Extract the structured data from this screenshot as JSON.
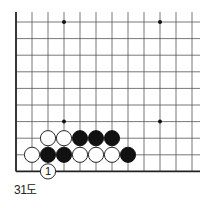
{
  "diagram": {
    "caption": "31도",
    "board": {
      "origin_x": 16,
      "origin_y": 22,
      "spacing_x": 16,
      "spacing_y": 16.6,
      "cols": 12,
      "rows": 10,
      "right_edge": 200,
      "line_color": "#555555",
      "edge_color": "#222222",
      "star_points": [
        [
          3,
          0
        ],
        [
          9,
          0
        ],
        [
          3,
          6
        ],
        [
          9,
          6
        ]
      ]
    },
    "stones": [
      {
        "col": 2,
        "row": 7,
        "color": "white"
      },
      {
        "col": 3,
        "row": 7,
        "color": "white"
      },
      {
        "col": 4,
        "row": 7,
        "color": "black"
      },
      {
        "col": 5,
        "row": 7,
        "color": "black"
      },
      {
        "col": 6,
        "row": 7,
        "color": "black"
      },
      {
        "col": 1,
        "row": 8,
        "color": "white"
      },
      {
        "col": 2,
        "row": 8,
        "color": "black"
      },
      {
        "col": 3,
        "row": 8,
        "color": "black"
      },
      {
        "col": 4,
        "row": 8,
        "color": "white"
      },
      {
        "col": 5,
        "row": 8,
        "color": "white"
      },
      {
        "col": 6,
        "row": 8,
        "color": "white"
      },
      {
        "col": 7,
        "row": 8,
        "color": "black"
      },
      {
        "col": 2,
        "row": 9,
        "color": "white",
        "label": "1"
      }
    ]
  }
}
